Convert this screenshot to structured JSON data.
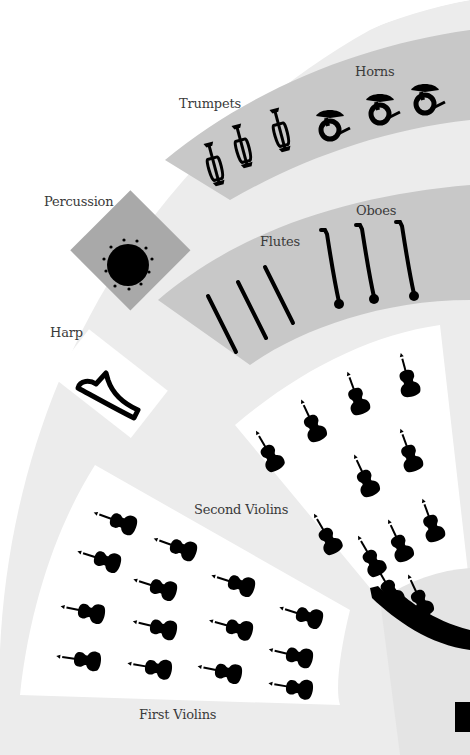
{
  "diagram": {
    "type": "orchestra-seating-chart",
    "colors": {
      "background": "#ffffff",
      "outer_band": "#ececec",
      "section_gray": "#c8c8c8",
      "percussion_fill": "#a9a9a9",
      "string_sections": "#ffffff",
      "podium": "#e4e4e4",
      "instrument_ink": "#000000",
      "label_text": "#3a3a3a"
    },
    "sections": [
      {
        "id": "trumpets",
        "label": "Trumpets",
        "count": 3,
        "icon": "trumpet-icon"
      },
      {
        "id": "horns",
        "label": "Horns",
        "count": 3,
        "icon": "french-horn-icon"
      },
      {
        "id": "percussion",
        "label": "Percussion",
        "count": 1,
        "icon": "timpani-icon"
      },
      {
        "id": "flutes",
        "label": "Flutes",
        "count": 3,
        "icon": "flute-icon"
      },
      {
        "id": "oboes",
        "label": "Oboes",
        "count": 3,
        "icon": "oboe-icon"
      },
      {
        "id": "harp",
        "label": "Harp",
        "count": 1,
        "icon": "harp-icon"
      },
      {
        "id": "second_violins",
        "label": "Second Violins",
        "count": 12,
        "icon": "violin-icon"
      },
      {
        "id": "first_violins",
        "label": "First Violins",
        "count": 16,
        "icon": "violin-icon"
      },
      {
        "id": "conductor",
        "label": "",
        "count": 1,
        "icon": "conductor-arm-icon"
      }
    ]
  }
}
